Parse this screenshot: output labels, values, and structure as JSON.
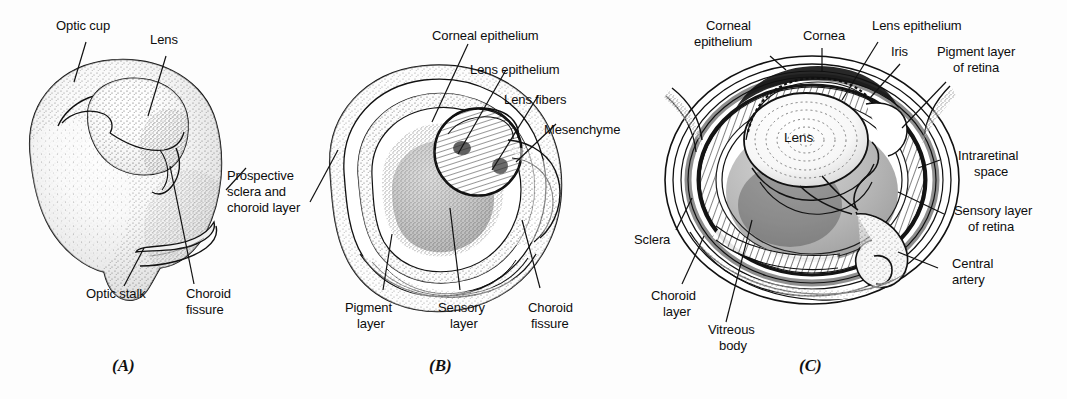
{
  "figure": {
    "background_color": "#fdfdfd",
    "ink_color": "#111111"
  },
  "panels": [
    {
      "id": "A",
      "caption": "(A)",
      "description": "Optic cup with lens vesicle and optic stalk, surface-stippled three-quarter view",
      "labels": [
        {
          "name": "optic-cup",
          "text": "Optic cup",
          "lines": [
            "Optic cup"
          ]
        },
        {
          "name": "lens",
          "text": "Lens",
          "lines": [
            "Lens"
          ]
        },
        {
          "name": "prospective-sclera-and-choroid-layer",
          "text": "Prospective sclera and choroid layer",
          "lines": [
            "Prospective",
            "sclera and",
            "choroid layer"
          ]
        },
        {
          "name": "optic-stalk",
          "text": "Optic stalk",
          "lines": [
            "Optic stalk"
          ]
        },
        {
          "name": "choroid-fissure",
          "text": "Choroid fissure",
          "lines": [
            "Choroid",
            "fissure"
          ]
        }
      ]
    },
    {
      "id": "B",
      "caption": "(B)",
      "description": "Sectioned optic cup showing developing lens with fibers, pigment and sensory retinal layers",
      "labels": [
        {
          "name": "corneal-epithelium",
          "text": "Corneal epithelium",
          "lines": [
            "Corneal epithelium"
          ]
        },
        {
          "name": "lens-epithelium",
          "text": "Lens epithelium",
          "lines": [
            "Lens epithelium"
          ]
        },
        {
          "name": "lens-fibers",
          "text": "Lens fibers",
          "lines": [
            "Lens fibers"
          ]
        },
        {
          "name": "mesenchyme",
          "text": "Mesenchyme",
          "lines": [
            "Mesenchyme"
          ]
        },
        {
          "name": "pigment-layer",
          "text": "Pigment layer",
          "lines": [
            "Pigment",
            "layer"
          ]
        },
        {
          "name": "sensory-layer",
          "text": "Sensory layer",
          "lines": [
            "Sensory",
            "layer"
          ]
        },
        {
          "name": "choroid-fissure",
          "text": "Choroid fissure",
          "lines": [
            "Choroid",
            "fissure"
          ]
        }
      ]
    },
    {
      "id": "C",
      "caption": "(C)",
      "description": "Fully formed eye cross-section with lens, iris, retina layers, choroid, sclera and central artery",
      "labels": [
        {
          "name": "corneal-epithelium",
          "text": "Corneal epithelium",
          "lines": [
            "Corneal",
            "epithelium"
          ]
        },
        {
          "name": "cornea",
          "text": "Cornea",
          "lines": [
            "Cornea"
          ]
        },
        {
          "name": "lens-epithelium",
          "text": "Lens epithelium",
          "lines": [
            "Lens epithelium"
          ]
        },
        {
          "name": "iris",
          "text": "Iris",
          "lines": [
            "Iris"
          ]
        },
        {
          "name": "pigment-layer-of-retina",
          "text": "Pigment layer of retina",
          "lines": [
            "Pigment layer",
            "of retina"
          ]
        },
        {
          "name": "intraretinal-space",
          "text": "Intraretinal space",
          "lines": [
            "Intraretinal",
            "space"
          ]
        },
        {
          "name": "sensory-layer-of-retina",
          "text": "Sensory layer of retina",
          "lines": [
            "Sensory layer",
            "of retina"
          ]
        },
        {
          "name": "central-artery",
          "text": "Central artery",
          "lines": [
            "Central",
            "artery"
          ]
        },
        {
          "name": "sclera",
          "text": "Sclera",
          "lines": [
            "Sclera"
          ]
        },
        {
          "name": "choroid-layer",
          "text": "Choroid layer",
          "lines": [
            "Choroid",
            "layer"
          ]
        },
        {
          "name": "vitreous-body",
          "text": "Vitreous body",
          "lines": [
            "Vitreous",
            "body"
          ]
        },
        {
          "name": "lens",
          "text": "Lens",
          "lines": [
            "Lens"
          ]
        }
      ]
    }
  ],
  "text": {
    "a_optic_cup": "Optic cup",
    "a_lens": "Lens",
    "a_prospective_1": "Prospective",
    "a_prospective_2": "sclera and",
    "a_prospective_3": "choroid layer",
    "a_optic_stalk": "Optic stalk",
    "a_choroid_1": "Choroid",
    "a_choroid_2": "fissure",
    "a_caption": "(A)",
    "b_corneal_epithelium": "Corneal epithelium",
    "b_lens_epithelium": "Lens epithelium",
    "b_lens_fibers": "Lens fibers",
    "b_mesenchyme": "Mesenchyme",
    "b_pigment_1": "Pigment",
    "b_pigment_2": "layer",
    "b_sensory_1": "Sensory",
    "b_sensory_2": "layer",
    "b_choroid_1": "Choroid",
    "b_choroid_2": "fissure",
    "b_caption": "(B)",
    "c_corneal_1": "Corneal",
    "c_corneal_2": "epithelium",
    "c_cornea": "Cornea",
    "c_lens_epithelium": "Lens epithelium",
    "c_iris": "Iris",
    "c_pigment_1": "Pigment layer",
    "c_pigment_2": "of retina",
    "c_intraretinal_1": "Intraretinal",
    "c_intraretinal_2": "space",
    "c_sensory_1": "Sensory layer",
    "c_sensory_2": "of retina",
    "c_central_1": "Central",
    "c_central_2": "artery",
    "c_sclera": "Sclera",
    "c_choroid_1": "Choroid",
    "c_choroid_2": "layer",
    "c_vitreous_1": "Vitreous",
    "c_vitreous_2": "body",
    "c_lens": "Lens",
    "c_caption": "(C)"
  }
}
